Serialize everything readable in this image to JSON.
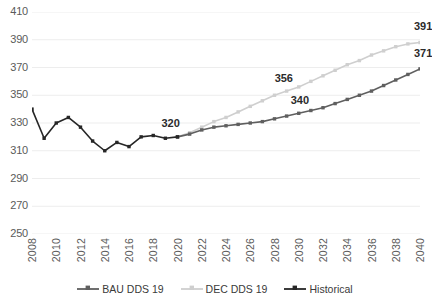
{
  "chart_data": {
    "type": "line",
    "title": "",
    "xlabel": "",
    "ylabel": "",
    "ylim": [
      250,
      410
    ],
    "ytick_step": 20,
    "yticks": [
      410,
      390,
      370,
      350,
      330,
      310,
      290,
      270,
      250
    ],
    "grid": true,
    "grid_axis": "y",
    "legend_position": "bottom",
    "xlim": [
      2008,
      2040
    ],
    "xtick_step": 2,
    "xticks": [
      2008,
      2010,
      2012,
      2014,
      2016,
      2018,
      2020,
      2022,
      2024,
      2026,
      2028,
      2030,
      2032,
      2034,
      2036,
      2038,
      2040
    ],
    "x": [
      2008,
      2009,
      2010,
      2011,
      2012,
      2013,
      2014,
      2015,
      2016,
      2017,
      2018,
      2019,
      2020,
      2021,
      2022,
      2023,
      2024,
      2025,
      2026,
      2027,
      2028,
      2029,
      2030,
      2031,
      2032,
      2033,
      2034,
      2035,
      2036,
      2037,
      2038,
      2039,
      2040
    ],
    "series": [
      {
        "name": "Historical",
        "color": "#262626",
        "values": [
          340,
          319,
          330,
          334,
          327,
          317,
          310,
          316,
          313,
          320,
          321,
          319,
          320,
          null,
          null,
          null,
          null,
          null,
          null,
          null,
          null,
          null,
          null,
          null,
          null,
          null,
          null,
          null,
          null,
          null,
          null,
          null,
          null
        ]
      },
      {
        "name": "BAU DDS 19",
        "color": "#5f5f5f",
        "values": [
          null,
          null,
          null,
          null,
          null,
          null,
          null,
          null,
          null,
          null,
          null,
          null,
          320,
          322,
          325,
          327,
          328,
          329,
          330,
          331,
          333,
          335,
          337,
          339,
          341,
          344,
          347,
          350,
          353,
          357,
          361,
          365,
          369
        ]
      },
      {
        "name": "DEC DDS 19",
        "color": "#cfcfcf",
        "values": [
          null,
          null,
          null,
          null,
          null,
          null,
          null,
          null,
          null,
          null,
          null,
          null,
          320,
          323,
          327,
          331,
          334,
          338,
          342,
          346,
          350,
          353,
          356,
          360,
          364,
          368,
          372,
          375,
          379,
          382,
          385,
          387,
          388
        ]
      }
    ],
    "annotations": [
      {
        "text": "320",
        "x": 2020,
        "y": 320,
        "dx": -16,
        "dy": -13
      },
      {
        "text": "340",
        "x": 2030,
        "y": 337,
        "dx": -8,
        "dy": -12
      },
      {
        "text": "356",
        "x": 2029,
        "y": 353,
        "dx": -12,
        "dy": -12
      },
      {
        "text": "371",
        "x": 2040,
        "y": 369,
        "dx": -6,
        "dy": -15
      },
      {
        "text": "391",
        "x": 2040,
        "y": 388,
        "dx": -6,
        "dy": -16
      }
    ]
  },
  "legend": {
    "items": [
      {
        "label": "BAU DDS 19",
        "color": "#5f5f5f"
      },
      {
        "label": "DEC DDS 19",
        "color": "#cfcfcf"
      },
      {
        "label": "Historical",
        "color": "#262626"
      }
    ]
  },
  "colors": {
    "background": "#ffffff",
    "gridline": "#ededed",
    "tick_text": "#5a5a5a",
    "label_text": "#2b2b2b"
  }
}
